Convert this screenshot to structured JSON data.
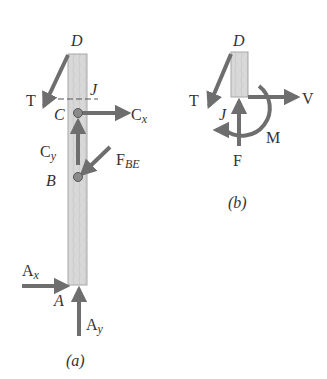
{
  "figures": {
    "a": {
      "caption": "(a)",
      "points": {
        "D": "D",
        "J": "J",
        "C": "C",
        "B": "B",
        "A": "A"
      },
      "forces": {
        "T": "T",
        "Cx": {
          "main": "C",
          "sub": "x"
        },
        "Cy": {
          "main": "C",
          "sub": "y"
        },
        "FBE": {
          "main": "F",
          "sub": "BE"
        },
        "Ax": {
          "main": "A",
          "sub": "x"
        },
        "Ay": {
          "main": "A",
          "sub": "y"
        }
      }
    },
    "b": {
      "caption": "(b)",
      "points": {
        "D": "D",
        "J": "J"
      },
      "forces": {
        "T": "T",
        "V": "V",
        "F": "F",
        "M": "M"
      }
    }
  },
  "colors": {
    "arrow": "#6e6e6e",
    "member_fill": "#d9d9d9",
    "member_edge": "#a8a8a8",
    "pin": "#8a8a8a",
    "text": "#333333"
  }
}
